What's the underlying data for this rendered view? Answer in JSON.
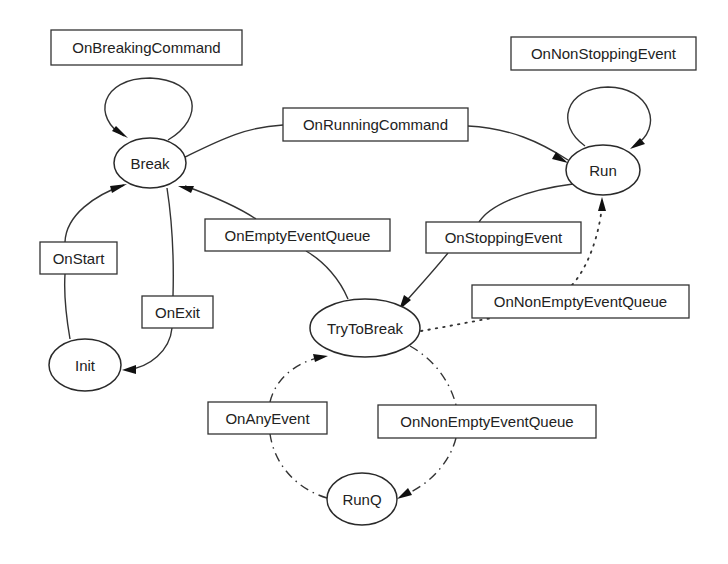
{
  "diagram": {
    "type": "state-machine",
    "colors": {
      "stroke": "#333333",
      "text": "#222222",
      "background": "#ffffff"
    },
    "states": [
      {
        "id": "break",
        "label": "Break",
        "cx": 150,
        "cy": 163,
        "rx": 36,
        "ry": 25
      },
      {
        "id": "run",
        "label": "Run",
        "cx": 603,
        "cy": 170,
        "rx": 37,
        "ry": 25
      },
      {
        "id": "init",
        "label": "Init",
        "cx": 85,
        "cy": 365,
        "rx": 36,
        "ry": 26
      },
      {
        "id": "trytobreak",
        "label": "TryToBreak",
        "cx": 365,
        "cy": 328,
        "rx": 55,
        "ry": 29
      },
      {
        "id": "runq",
        "label": "RunQ",
        "cx": 362,
        "cy": 499,
        "rx": 35,
        "ry": 26
      }
    ],
    "transitions": [
      {
        "id": "on-breaking-command",
        "label": "OnBreakingCommand",
        "from": "Break",
        "to": "Break",
        "style": "solid",
        "box": [
          51,
          30,
          191,
          35
        ]
      },
      {
        "id": "on-non-stopping-event",
        "label": "OnNonStoppingEvent",
        "from": "Run",
        "to": "Run",
        "style": "solid",
        "box": [
          511,
          37,
          185,
          33
        ]
      },
      {
        "id": "on-running-command",
        "label": "OnRunningCommand",
        "from": "Break",
        "to": "Run",
        "style": "solid",
        "box": [
          283,
          108,
          185,
          33
        ]
      },
      {
        "id": "on-start",
        "label": "OnStart",
        "from": "Init",
        "to": "Break",
        "style": "solid",
        "box": [
          40,
          242,
          77,
          32
        ]
      },
      {
        "id": "on-exit",
        "label": "OnExit",
        "from": "Break",
        "to": "Init",
        "style": "solid",
        "box": [
          142,
          296,
          71,
          32
        ]
      },
      {
        "id": "on-empty-event-queue",
        "label": "OnEmptyEventQueue",
        "from": "TryToBreak",
        "to": "Break",
        "style": "solid",
        "box": [
          205,
          219,
          185,
          32
        ]
      },
      {
        "id": "on-stopping-event",
        "label": "OnStoppingEvent",
        "from": "Run",
        "to": "TryToBreak",
        "style": "solid",
        "box": [
          426,
          222,
          155,
          31
        ]
      },
      {
        "id": "on-non-empty-event-queue-run",
        "label": "OnNonEmptyEventQueue",
        "from": "TryToBreak",
        "to": "Run",
        "style": "dotted",
        "box": [
          472,
          285,
          217,
          33
        ]
      },
      {
        "id": "on-any-event",
        "label": "OnAnyEvent",
        "from": "RunQ",
        "to": "TryToBreak",
        "style": "dash-dot",
        "box": [
          208,
          402,
          119,
          32
        ]
      },
      {
        "id": "on-non-empty-event-queue-runq",
        "label": "OnNonEmptyEventQueue",
        "from": "TryToBreak",
        "to": "RunQ",
        "style": "dash-dot",
        "box": [
          378,
          405,
          218,
          33
        ]
      }
    ]
  }
}
